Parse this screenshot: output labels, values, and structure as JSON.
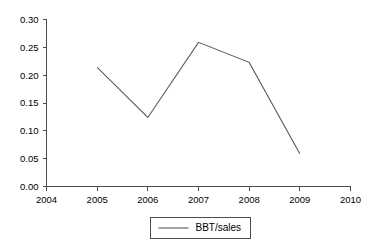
{
  "chart_data": {
    "type": "line",
    "title": "",
    "subtitle": "",
    "xlabel": "",
    "ylabel": "",
    "x": [
      2005,
      2006,
      2007,
      2008,
      2009
    ],
    "xlim": [
      2004,
      2010
    ],
    "ylim": [
      0.0,
      0.3
    ],
    "grid": false,
    "legend_position": "bottom-center",
    "series": [
      {
        "name": "BBT/sales",
        "color": "#595959",
        "values": [
          0.214,
          0.124,
          0.259,
          0.223,
          0.059
        ]
      }
    ],
    "x_tick_labels": [
      "2004",
      "2005",
      "2006",
      "2007",
      "2008",
      "2009",
      "2010"
    ],
    "x_tick_values": [
      2004,
      2005,
      2006,
      2007,
      2008,
      2009,
      2010
    ],
    "y_tick_labels": [
      "0.00",
      "0.05",
      "0.10",
      "0.15",
      "0.20",
      "0.25",
      "0.30"
    ],
    "y_tick_values": [
      0.0,
      0.05,
      0.1,
      0.15,
      0.2,
      0.25,
      0.3
    ],
    "annotations": []
  },
  "legend": {
    "entries": [
      {
        "label": "BBT/sales",
        "color": "#595959"
      }
    ]
  },
  "colors": {
    "background": "#ffffff",
    "axis": "#4d4d4d",
    "series": "#595959",
    "text": "#000000"
  }
}
